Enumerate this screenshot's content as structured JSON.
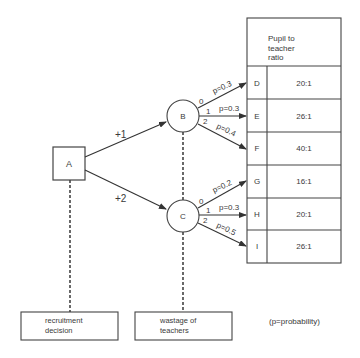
{
  "diagram": {
    "decision_node": {
      "label": "A"
    },
    "chance_nodes": [
      {
        "label": "B",
        "branch_from_A": "+1"
      },
      {
        "label": "C",
        "branch_from_A": "+2"
      }
    ],
    "branches_B": [
      {
        "num": "0",
        "p": "p=0.3",
        "outcome": "D"
      },
      {
        "num": "1",
        "p": "p=0.3",
        "outcome": "E"
      },
      {
        "num": "2",
        "p": "p=0.4",
        "outcome": "F"
      }
    ],
    "branches_C": [
      {
        "num": "0",
        "p": "p=0.2",
        "outcome": "G"
      },
      {
        "num": "1",
        "p": "p=0.3",
        "outcome": "H"
      },
      {
        "num": "2",
        "p": "p=0.5",
        "outcome": "I"
      }
    ],
    "table": {
      "header": [
        "Pupil to",
        "teacher",
        "ratio"
      ],
      "rows": [
        {
          "id": "D",
          "ratio": "20:1"
        },
        {
          "id": "E",
          "ratio": "26:1"
        },
        {
          "id": "F",
          "ratio": "40:1"
        },
        {
          "id": "G",
          "ratio": "16:1"
        },
        {
          "id": "H",
          "ratio": "20:1"
        },
        {
          "id": "I",
          "ratio": "26:1"
        }
      ]
    },
    "legend_boxes": [
      {
        "lines": [
          "recruitment",
          "decision"
        ]
      },
      {
        "lines": [
          "wastage of",
          "teachers"
        ]
      }
    ],
    "note": "(p=probability)"
  }
}
